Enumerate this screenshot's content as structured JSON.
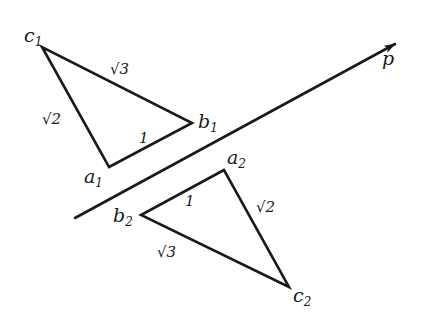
{
  "diagram": {
    "type": "geometry-reflection",
    "axis": {
      "label": "p",
      "from": [
        75,
        218
      ],
      "to": [
        395,
        44
      ]
    },
    "triangle1": {
      "vertices": {
        "a": {
          "name": "a",
          "sub": "1",
          "pos": [
            109,
            167
          ]
        },
        "b": {
          "name": "b",
          "sub": "1",
          "pos": [
            192,
            123
          ]
        },
        "c": {
          "name": "c",
          "sub": "1",
          "pos": [
            42,
            47
          ]
        }
      },
      "edges": {
        "ab": "1",
        "bc": "√3",
        "ca": "√2"
      }
    },
    "triangle2": {
      "vertices": {
        "a": {
          "name": "a",
          "sub": "2",
          "pos": [
            224,
            170
          ]
        },
        "b": {
          "name": "b",
          "sub": "2",
          "pos": [
            141,
            215
          ]
        },
        "c": {
          "name": "c",
          "sub": "2",
          "pos": [
            289,
            287
          ]
        }
      },
      "edges": {
        "ab": "1",
        "bc": "√3",
        "ca": "√2"
      }
    }
  }
}
